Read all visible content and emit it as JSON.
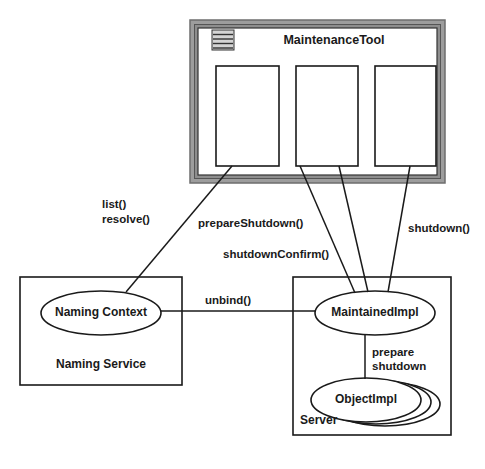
{
  "diagram": {
    "type": "uml-object-diagram"
  },
  "maintenance_tool": {
    "title": "MaintenanceTool",
    "menu_icon": "window-menu-icon",
    "frame_color": "#808080",
    "panes": [
      {
        "name": "pane-1"
      },
      {
        "name": "pane-2"
      },
      {
        "name": "pane-3"
      }
    ]
  },
  "naming_service": {
    "box_label": "Naming Service",
    "object_label": "Naming Context"
  },
  "server": {
    "box_label": "Server",
    "maintained_label": "MaintainedImpl",
    "object_impl_label": "ObjectImpl",
    "object_impl_stack_count": 3
  },
  "edge_labels": {
    "list": "list()",
    "resolve": "resolve()",
    "prepare_shutdown": "prepareShutdown()",
    "shutdown_confirm": "shutdownConfirm()",
    "shutdown": "shutdown()",
    "unbind": "unbind()",
    "prepare": "prepare",
    "shutdown_word": "shutdown"
  },
  "colors": {
    "stroke": "#1a1a1a",
    "frame_outer": "#9a9a9a",
    "frame_inner": "#6e6e6e",
    "background": "#ffffff"
  }
}
